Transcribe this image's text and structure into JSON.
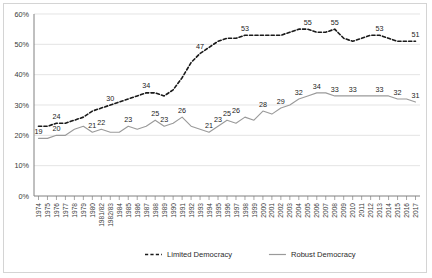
{
  "chart_data": {
    "type": "line",
    "title": "",
    "xlabel": "",
    "ylabel": "",
    "ylim": [
      0,
      60
    ],
    "y_unit": "%",
    "grid": true,
    "legend_position": "bottom",
    "categories": [
      "1974",
      "1975",
      "1976",
      "1977",
      "1978",
      "1979",
      "1980",
      "1981/82",
      "1982/83",
      "1984",
      "1985",
      "1986",
      "1987",
      "1988",
      "1989",
      "1990",
      "1991",
      "1992",
      "1993",
      "1994",
      "1995",
      "1996",
      "1997",
      "1998",
      "1999",
      "2000",
      "2001",
      "2002",
      "2003",
      "2004",
      "2005",
      "2006",
      "2007",
      "2008",
      "2009",
      "2010",
      "2011",
      "2012",
      "2013",
      "2014",
      "2015",
      "2016",
      "2017"
    ],
    "ytick_labels": [
      "0%",
      "10%",
      "20%",
      "30%",
      "40%",
      "50%",
      "60%"
    ],
    "ytick_values": [
      0,
      10,
      20,
      30,
      40,
      50,
      60
    ],
    "series": [
      {
        "name": "Limited Democracy",
        "color": "#1a1a1a",
        "style": "dashed",
        "values": [
          23,
          23,
          24,
          24,
          25,
          26,
          28,
          29,
          30,
          31,
          32,
          33,
          34,
          34,
          33,
          35,
          39,
          44,
          47,
          49,
          51,
          52,
          52,
          53,
          53,
          53,
          53,
          53,
          54,
          55,
          55,
          54,
          54,
          55,
          52,
          51,
          52,
          53,
          53,
          52,
          51,
          51,
          51
        ],
        "labels": [
          {
            "index": 2,
            "value": 24
          },
          {
            "index": 8,
            "value": 30
          },
          {
            "index": 12,
            "value": 34
          },
          {
            "index": 18,
            "value": 47
          },
          {
            "index": 23,
            "value": 53
          },
          {
            "index": 30,
            "value": 55
          },
          {
            "index": 33,
            "value": 55
          },
          {
            "index": 38,
            "value": 53
          },
          {
            "index": 42,
            "value": 51
          }
        ]
      },
      {
        "name": "Robust Democracy",
        "color": "#9a9a9a",
        "style": "solid",
        "values": [
          19,
          19,
          20,
          20,
          22,
          23,
          21,
          22,
          21,
          21,
          23,
          22,
          23,
          25,
          23,
          24,
          26,
          23,
          22,
          21,
          23,
          25,
          24,
          26,
          25,
          28,
          27,
          29,
          30,
          32,
          33,
          34,
          34,
          33,
          33,
          33,
          33,
          33,
          33,
          33,
          32,
          32,
          31
        ],
        "labels": [
          {
            "index": 0,
            "value": 19
          },
          {
            "index": 2,
            "value": 20
          },
          {
            "index": 6,
            "value": 21
          },
          {
            "index": 7,
            "value": 22
          },
          {
            "index": 10,
            "value": 23
          },
          {
            "index": 13,
            "value": 25
          },
          {
            "index": 14,
            "value": 23
          },
          {
            "index": 16,
            "value": 26
          },
          {
            "index": 19,
            "value": 21
          },
          {
            "index": 20,
            "value": 23
          },
          {
            "index": 21,
            "value": 25
          },
          {
            "index": 22,
            "value": 26
          },
          {
            "index": 25,
            "value": 28
          },
          {
            "index": 27,
            "value": 29
          },
          {
            "index": 29,
            "value": 32
          },
          {
            "index": 31,
            "value": 34
          },
          {
            "index": 33,
            "value": 33
          },
          {
            "index": 35,
            "value": 33
          },
          {
            "index": 38,
            "value": 33
          },
          {
            "index": 40,
            "value": 32
          },
          {
            "index": 42,
            "value": 31
          }
        ]
      }
    ],
    "legend": [
      {
        "label": "Limited Democracy",
        "style": "dashed",
        "color": "#1a1a1a"
      },
      {
        "label": "Robust Democracy",
        "style": "solid",
        "color": "#9a9a9a"
      }
    ]
  }
}
